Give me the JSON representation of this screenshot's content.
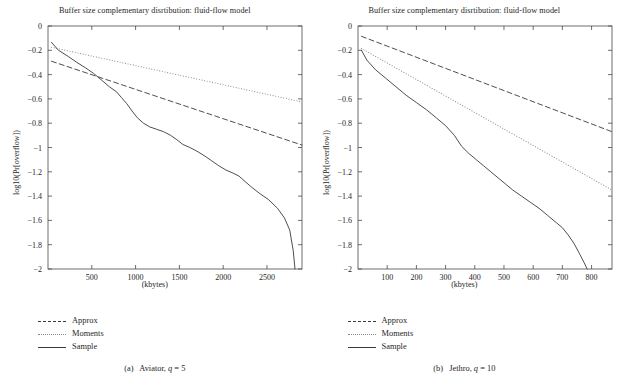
{
  "figure": {
    "panels": [
      {
        "id": "panel-a",
        "title": "Buffer size complementary disrtibution: fluid-flow model",
        "caption_prefix": "(a)",
        "caption_text": "Aviator,",
        "caption_param": "q",
        "caption_value": "= 5",
        "xlabel": "(kbytes)",
        "ylabel": "log10(Pr[overflow])",
        "legend": [
          {
            "label": "Approx",
            "style": "dashed"
          },
          {
            "label": "Moments",
            "style": "dotted"
          },
          {
            "label": "Sample",
            "style": "solid"
          }
        ],
        "chart_data": {
          "type": "line",
          "title": "Buffer size complementary disrtibution: fluid-flow model",
          "xlabel": "(kbytes)",
          "ylabel": "log10(Pr[overflow])",
          "xlim": [
            0,
            2900
          ],
          "ylim": [
            -2,
            0
          ],
          "xticks": [
            500,
            1000,
            1500,
            2000,
            2500
          ],
          "yticks": [
            0,
            -0.2,
            -0.4,
            -0.6,
            -0.8,
            -1,
            -1.2,
            -1.4,
            -1.6,
            -1.8,
            -2
          ],
          "grid": false,
          "legend_position": "below-left",
          "series": [
            {
              "name": "Approx",
              "style": "dashed",
              "x": [
                40,
                2900
              ],
              "y": [
                -0.29,
                -0.98
              ]
            },
            {
              "name": "Moments",
              "style": "dotted",
              "x": [
                40,
                2900
              ],
              "y": [
                -0.175,
                -0.625
              ]
            },
            {
              "name": "Sample",
              "style": "solid",
              "x": [
                40,
                120,
                230,
                330,
                430,
                520,
                620,
                700,
                780,
                840,
                900,
                960,
                1020,
                1090,
                1160,
                1240,
                1320,
                1400,
                1470,
                1540,
                1620,
                1700,
                1790,
                1870,
                1950,
                2030,
                2110,
                2180,
                2250,
                2330,
                2420,
                2520,
                2620,
                2700,
                2760,
                2800,
                2820
              ],
              "y": [
                -0.135,
                -0.2,
                -0.25,
                -0.3,
                -0.345,
                -0.39,
                -0.45,
                -0.5,
                -0.54,
                -0.59,
                -0.64,
                -0.7,
                -0.755,
                -0.8,
                -0.83,
                -0.85,
                -0.87,
                -0.9,
                -0.935,
                -0.975,
                -1.0,
                -1.03,
                -1.07,
                -1.11,
                -1.15,
                -1.185,
                -1.21,
                -1.235,
                -1.28,
                -1.33,
                -1.38,
                -1.43,
                -1.5,
                -1.58,
                -1.68,
                -1.85,
                -2.0
              ]
            }
          ]
        }
      },
      {
        "id": "panel-b",
        "title": "Buffer size complementary disrtibution: fluid-flow model",
        "caption_prefix": "(b)",
        "caption_text": "Jethro,",
        "caption_param": "q",
        "caption_value": "= 10",
        "xlabel": "(kbytes)",
        "ylabel": "log10(Pr[overflow])",
        "legend": [
          {
            "label": "Approx",
            "style": "dashed"
          },
          {
            "label": "Moments",
            "style": "dotted"
          },
          {
            "label": "Sample",
            "style": "solid"
          }
        ],
        "chart_data": {
          "type": "line",
          "title": "Buffer size complementary disrtibution: fluid-flow model",
          "xlabel": "(kbytes)",
          "ylabel": "log10(Pr[overflow])",
          "xlim": [
            0,
            870
          ],
          "ylim": [
            -2,
            0
          ],
          "xticks": [
            100,
            200,
            300,
            400,
            500,
            600,
            700,
            800
          ],
          "yticks": [
            0,
            -0.2,
            -0.4,
            -0.6,
            -0.8,
            -1,
            -1.2,
            -1.4,
            -1.6,
            -1.8,
            -2
          ],
          "grid": false,
          "legend_position": "below-left",
          "series": [
            {
              "name": "Approx",
              "style": "dashed",
              "x": [
                12,
                870
              ],
              "y": [
                -0.085,
                -0.87
              ]
            },
            {
              "name": "Moments",
              "style": "dotted",
              "x": [
                12,
                870
              ],
              "y": [
                -0.185,
                -1.35
              ]
            },
            {
              "name": "Sample",
              "style": "solid",
              "x": [
                12,
                30,
                60,
                95,
                130,
                165,
                200,
                235,
                270,
                300,
                330,
                355,
                380,
                405,
                430,
                455,
                480,
                505,
                530,
                560,
                590,
                620,
                650,
                680,
                700,
                720,
                740,
                760,
                775,
                785
              ],
              "y": [
                -0.2,
                -0.28,
                -0.36,
                -0.43,
                -0.5,
                -0.57,
                -0.63,
                -0.69,
                -0.76,
                -0.82,
                -0.9,
                -0.99,
                -1.05,
                -1.1,
                -1.15,
                -1.2,
                -1.25,
                -1.3,
                -1.35,
                -1.4,
                -1.45,
                -1.5,
                -1.56,
                -1.62,
                -1.66,
                -1.72,
                -1.79,
                -1.88,
                -1.95,
                -2.0
              ]
            }
          ]
        }
      }
    ]
  }
}
